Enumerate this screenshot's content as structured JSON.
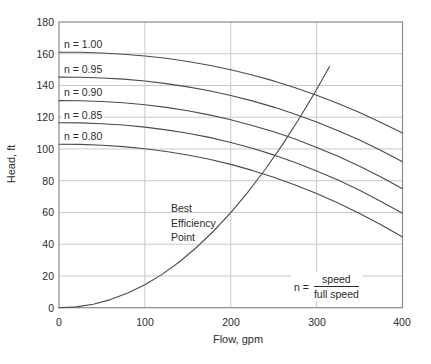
{
  "colors": {
    "curve": "#4b4b4b",
    "grid": "#c9c9c9",
    "frame": "#8a8a8a",
    "text": "#2b2b2b",
    "background": "#ffffff"
  },
  "chart_data": {
    "type": "line",
    "title": "",
    "xlabel": "Flow, gpm",
    "ylabel": "Head, ft",
    "xlim": [
      0,
      400
    ],
    "ylim": [
      0,
      180
    ],
    "xticks": [
      0,
      100,
      200,
      300,
      400
    ],
    "yticks": [
      0,
      20,
      40,
      60,
      80,
      100,
      120,
      140,
      160,
      180
    ],
    "xtick_labels": [
      "0",
      "100",
      "200",
      "300",
      "400"
    ],
    "ytick_labels": [
      "180",
      "160",
      "140",
      "120",
      "100",
      "80",
      "60",
      "40",
      "20",
      "0"
    ],
    "grid": {
      "on": true,
      "x": [
        100,
        200,
        300
      ],
      "y": [
        20,
        40,
        60,
        80,
        100,
        120,
        140,
        160
      ]
    },
    "legend_position": "labels-on-curves",
    "flow": [
      0,
      25,
      50,
      75,
      100,
      125,
      150,
      175,
      200,
      225,
      250,
      275,
      300,
      325,
      350,
      375,
      400
    ],
    "series": [
      {
        "label": "n = 1.00",
        "n": 1.0,
        "head": [
          161.0,
          160.9,
          160.5,
          159.7,
          158.6,
          157.1,
          155.1,
          152.7,
          149.9,
          146.6,
          142.9,
          138.6,
          133.9,
          128.7,
          123.0,
          116.7,
          110.0
        ]
      },
      {
        "label": "n = 0.95",
        "n": 0.95,
        "head": [
          145.3,
          145.2,
          144.7,
          144.0,
          142.8,
          141.2,
          139.1,
          136.7,
          133.7,
          130.3,
          126.4,
          121.9,
          117.0,
          111.5,
          105.6,
          99.1,
          92.0
        ]
      },
      {
        "label": "n = 0.90",
        "n": 0.9,
        "head": [
          130.5,
          130.4,
          129.9,
          129.1,
          127.9,
          126.2,
          124.1,
          121.5,
          118.4,
          114.8,
          110.8,
          106.2,
          101.0,
          95.4,
          89.1,
          82.3,
          75.0
        ]
      },
      {
        "label": "n = 0.85",
        "n": 0.85,
        "head": [
          116.5,
          116.4,
          115.9,
          115.1,
          113.8,
          112.0,
          109.9,
          107.3,
          104.1,
          100.4,
          96.3,
          91.5,
          86.2,
          80.4,
          74.0,
          67.0,
          59.5
        ]
      },
      {
        "label": "n = 0.80",
        "n": 0.8,
        "head": [
          103.0,
          102.9,
          102.4,
          101.5,
          100.2,
          98.4,
          96.2,
          93.5,
          90.3,
          86.5,
          82.2,
          77.3,
          71.9,
          65.9,
          59.4,
          52.2,
          44.5
        ]
      }
    ],
    "bep": {
      "label_lines": [
        "Best",
        "Efficiency",
        "Point"
      ],
      "flow": [
        0,
        20,
        40,
        60,
        80,
        100,
        120,
        140,
        160,
        180,
        200,
        220,
        240,
        260,
        280,
        300,
        315
      ],
      "head": [
        0,
        0.5,
        2.2,
        5.1,
        9.2,
        14.5,
        21.0,
        28.8,
        37.9,
        48.3,
        59.9,
        72.8,
        87.1,
        102.6,
        119.4,
        137.5,
        152.0
      ]
    },
    "annotation": {
      "lhs": "n =",
      "numerator": "speed",
      "denominator": "full speed"
    }
  }
}
